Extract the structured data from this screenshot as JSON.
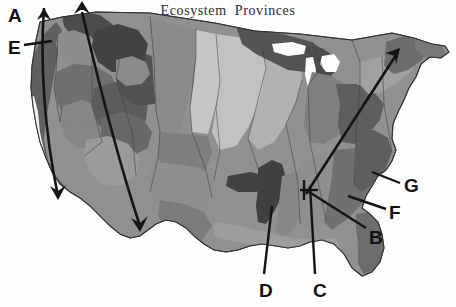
{
  "figure": {
    "title": "Ecosystem  Provinces",
    "width": 456,
    "height": 307,
    "background": "#ffffff",
    "type": "thematic-choropleth-map",
    "region": "Conterminous United States"
  },
  "palette": {
    "ocean_background": "#ffffff",
    "very_light_gray": "#d2d2d2",
    "light_gray": "#c0c0c0",
    "medium_light_gray": "#a8a8a8",
    "medium_gray": "#909090",
    "medium_dark_gray": "#7a7a7a",
    "dark_gray": "#5e5e5e",
    "very_dark_gray": "#3f3f3f",
    "outline": "#3a3a3a",
    "annotation_black": "#111111",
    "title_color": "#2b2b2b"
  },
  "callouts": [
    {
      "id": "A",
      "label": "A",
      "x": 8,
      "y": 6,
      "description": "upper-left, Pacific Northwest double-headed arrow"
    },
    {
      "id": "E",
      "label": "E",
      "x": 8,
      "y": 38,
      "description": "upper-left, Pacific coast leader line"
    },
    {
      "id": "G",
      "label": "G",
      "x": 404,
      "y": 176,
      "description": "right side, mid-Atlantic coastal plain leader"
    },
    {
      "id": "F",
      "label": "F",
      "x": 389,
      "y": 203,
      "description": "right side, southeastern piedmont leader"
    },
    {
      "id": "B",
      "label": "B",
      "x": 369,
      "y": 228,
      "description": "right side, southeastern coastal leader"
    },
    {
      "id": "D",
      "label": "D",
      "x": 259,
      "y": 281,
      "description": "bottom, Ozark / Ouachita highlands leader"
    },
    {
      "id": "C",
      "label": "C",
      "x": 313,
      "y": 281,
      "description": "bottom, lower Mississippi valley leader"
    }
  ],
  "annotation_arrows": [
    {
      "name": "pacific-coast-double-arrow",
      "heads": "both",
      "from": "Pacific Northwest coast",
      "to": "Southern California"
    },
    {
      "name": "intermountain-double-arrow",
      "heads": "both",
      "from": "Northern Rockies",
      "to": "Texas / Mexico border"
    },
    {
      "name": "appalachian-arrow",
      "heads": "one",
      "from": "Lower Mississippi Valley",
      "to": "Northern New England"
    }
  ],
  "leader_lines": [
    {
      "for": "E",
      "target": "Pacific Northwest coastal province"
    },
    {
      "for": "G",
      "target": "Atlantic coastal plain province"
    },
    {
      "for": "F",
      "target": "Southeastern mixed forest province"
    },
    {
      "for": "B",
      "target": "Outer coastal plain province"
    },
    {
      "for": "D",
      "target": "Ozark broadleaf forest province"
    },
    {
      "for": "C",
      "target": "Lower Mississippi riverine forest province"
    }
  ]
}
